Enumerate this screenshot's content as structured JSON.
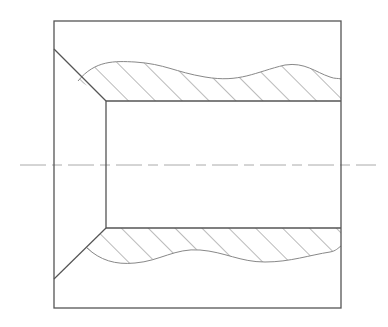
{
  "drawing": {
    "title": "Sectional view of bushing with chamfered bore and break lines",
    "colors": {
      "outline": "#555555",
      "hatch": "#666666",
      "break_line": "#888888",
      "centerline": "#aaaaaa",
      "background": "#ffffff"
    },
    "outer_box": {
      "x": 54,
      "y": 21,
      "w": 287,
      "h": 287
    },
    "bore": {
      "x": 106,
      "y": 101,
      "w": 235,
      "h": 127
    },
    "chamfer_top": {
      "x1": 54,
      "y1": 49,
      "x2": 106,
      "y2": 101
    },
    "chamfer_bottom": {
      "x1": 54,
      "y1": 279,
      "x2": 106,
      "y2": 228
    },
    "centerline": {
      "y": 165,
      "x1": 20,
      "x2": 376,
      "dash": "26 6 10 6"
    },
    "hatch_angle_deg": 45,
    "hatch_spacing": 19
  }
}
